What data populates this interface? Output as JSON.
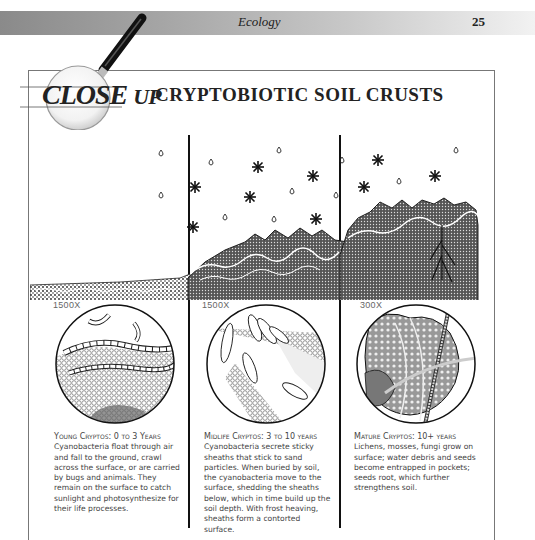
{
  "header": {
    "section": "Ecology",
    "page_number": "25"
  },
  "feature": {
    "logo_left": "CLOSE",
    "logo_right": "UP",
    "title": "CRYPTOBIOTIC SOIL CRUSTS"
  },
  "panels": [
    {
      "magnification": "1500X",
      "caption_heading": "Young Cryptos: 0 to 3 Years",
      "caption_body": "Cyanobacteria float through air and fall to the ground, crawl across the surface, or are carried by bugs and animals. They remain on the surface to catch sunlight and photosynthesize for their life processes."
    },
    {
      "magnification": "1500X",
      "caption_heading": "Midlife Cryptos: 3 to 10 years",
      "caption_body": "Cyanobacteria secrete sticky sheaths that stick to sand particles. When buried by soil, the cyanobacteria move to the surface, shedding the sheaths below, which in time build up the soil depth. With frost heaving, sheaths form a contorted surface."
    },
    {
      "magnification": "300X",
      "caption_heading": "Mature Cryptos: 10+ years",
      "caption_body": "Lichens, mosses, fungi grow on surface; water debris and seeds become entrapped in pockets; seeds root, which further strengthens soil."
    }
  ],
  "icons": {
    "magnifier": "magnifying-glass-icon",
    "raindrop": "raindrop-icon",
    "snowflake": "snowflake-icon"
  },
  "colors": {
    "ink": "#111111",
    "caption_text": "#444444",
    "frame": "#777777",
    "header_gradient_start": "#8a8a8a",
    "header_gradient_end": "#f2f2f2"
  }
}
